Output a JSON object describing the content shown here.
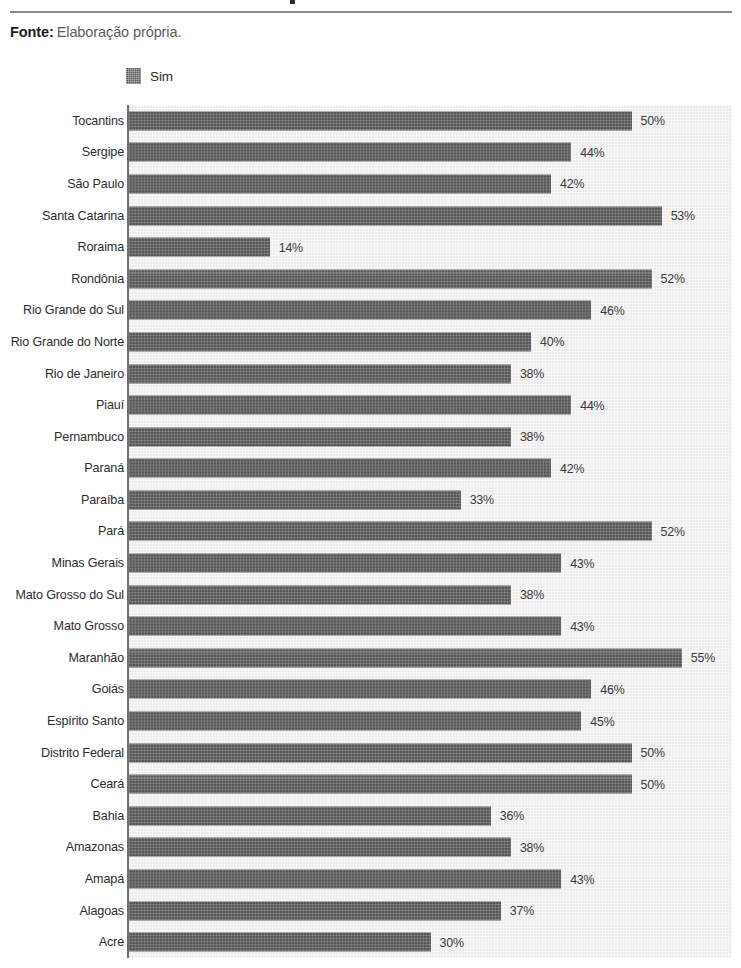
{
  "source": {
    "label": "Fonte:",
    "text": "Elaboração própria."
  },
  "legend": {
    "entries": [
      {
        "label": "Sim",
        "color": "#575757"
      }
    ]
  },
  "colors": {
    "bar": "#575757",
    "plot_background": "#ececec",
    "axis": "#6f6f6f",
    "text": "#2d2d2d",
    "rule": "#8d8d8d"
  },
  "chart_data": {
    "type": "bar",
    "orientation": "horizontal",
    "title": "",
    "xlabel": "",
    "ylabel": "",
    "xlim": [
      0,
      60
    ],
    "grid": false,
    "legend_position": "top-left",
    "value_suffix": "%",
    "series_name": "Sim",
    "categories": [
      "Tocantins",
      "Sergipe",
      "São Paulo",
      "Santa Catarina",
      "Roraima",
      "Rondônia",
      "Rio Grande do Sul",
      "Rio Grande do Norte",
      "Rio de Janeiro",
      "Piauí",
      "Pernambuco",
      "Paraná",
      "Paraíba",
      "Pará",
      "Minas Gerais",
      "Mato Grosso do Sul",
      "Mato Grosso",
      "Maranhão",
      "Goiás",
      "Espírito Santo",
      "Distrito Federal",
      "Ceará",
      "Bahia",
      "Amazonas",
      "Amapá",
      "Alagoas",
      "Acre"
    ],
    "values": [
      50,
      44,
      42,
      53,
      14,
      52,
      46,
      40,
      38,
      44,
      38,
      42,
      33,
      52,
      43,
      38,
      43,
      55,
      46,
      45,
      50,
      50,
      36,
      38,
      43,
      37,
      30
    ],
    "labels": [
      "50%",
      "44%",
      "42%",
      "53%",
      "14%",
      "52%",
      "46%",
      "40%",
      "38%",
      "44%",
      "38%",
      "42%",
      "33%",
      "52%",
      "43%",
      "38%",
      "43%",
      "55%",
      "46%",
      "45%",
      "50%",
      "50%",
      "36%",
      "38%",
      "43%",
      "37%",
      "30%"
    ]
  }
}
